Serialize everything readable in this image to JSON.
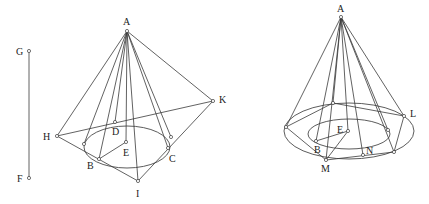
{
  "figure": {
    "left": {
      "labels": {
        "A": "A",
        "G": "G",
        "F": "F",
        "H": "H",
        "K": "K",
        "D": "D",
        "E": "E",
        "B": "B",
        "C": "C",
        "I": "I"
      }
    },
    "right": {
      "labels": {
        "A": "A",
        "L": "L",
        "E": "E",
        "B": "B",
        "N": "N",
        "M": "M"
      }
    }
  }
}
